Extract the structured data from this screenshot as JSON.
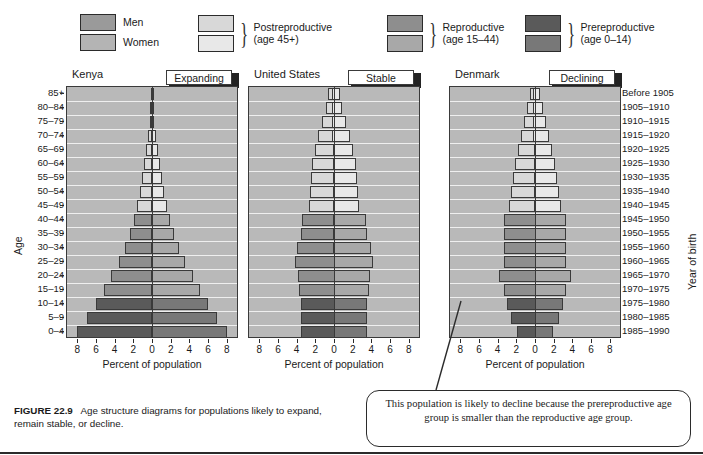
{
  "figure": {
    "number": "FIGURE 22.9",
    "caption": "Age structure diagrams for populations likely to expand, remain stable, or decline."
  },
  "legend": {
    "sex": [
      {
        "label": "Men",
        "color": "#9a9a9a"
      },
      {
        "label": "Women",
        "color": "#b4b4b4"
      }
    ],
    "groups": [
      {
        "label_line1": "Postreproductive",
        "label_line2": "(age 45+)",
        "men_color": "#d8d8d8",
        "women_color": "#e8e8e8"
      },
      {
        "label_line1": "Reproductive",
        "label_line2": "(age 15–44)",
        "men_color": "#8e8e8e",
        "women_color": "#a8a8a8"
      },
      {
        "label_line1": "Prereproductive",
        "label_line2": "(age 0–14)",
        "men_color": "#5a5a5a",
        "women_color": "#787878"
      }
    ]
  },
  "axes": {
    "y_left_title": "Age",
    "y_right_title": "Year of birth",
    "x_title": "Percent of population",
    "x_ticks": [
      "8",
      "6",
      "4",
      "2",
      "0",
      "2",
      "4",
      "6",
      "8"
    ],
    "x_max": 9.2,
    "age_groups": [
      "85+",
      "80–84",
      "75–79",
      "70–74",
      "65–69",
      "60–64",
      "55–59",
      "50–54",
      "45–49",
      "40–44",
      "35–39",
      "30–34",
      "25–29",
      "20–24",
      "15–19",
      "10–14",
      "5–9",
      "0–4"
    ],
    "years_of_birth": [
      "Before 1905",
      "1905–1910",
      "1910–1915",
      "1915–1920",
      "1920–1925",
      "1925–1930",
      "1930–1935",
      "1935–1940",
      "1940–1945",
      "1945–1950",
      "1950–1955",
      "1955–1960",
      "1960–1965",
      "1965–1970",
      "1970–1975",
      "1975–1980",
      "1980–1985",
      "1985–1990"
    ]
  },
  "callout": {
    "text": "This population is likely to decline because the prereproductive age group is smaller than the reproductive age group."
  },
  "chart_data": {
    "type": "bar",
    "title": "Age structure diagrams for populations likely to expand, remain stable, or decline.",
    "subtype": "population-pyramid",
    "xlabel": "Percent of population",
    "ylabel": "Age",
    "ylabel_right": "Year of birth",
    "xlim": [
      -9.2,
      9.2
    ],
    "xticks": [
      8,
      6,
      4,
      2,
      0,
      2,
      4,
      6,
      8
    ],
    "grid": true,
    "legend_position": "top",
    "categories": [
      "85+",
      "80–84",
      "75–79",
      "70–74",
      "65–69",
      "60–64",
      "55–59",
      "50–54",
      "45–49",
      "40–44",
      "35–39",
      "30–34",
      "25–29",
      "20–24",
      "15–19",
      "10–14",
      "5–9",
      "0–4"
    ],
    "age_class": [
      "post",
      "post",
      "post",
      "post",
      "post",
      "post",
      "post",
      "post",
      "post",
      "repro",
      "repro",
      "repro",
      "repro",
      "repro",
      "repro",
      "pre",
      "pre",
      "pre"
    ],
    "panels": [
      {
        "name": "Kenya",
        "tab": "Expanding",
        "series": [
          {
            "name": "Men",
            "values": [
              0.12,
              0.2,
              0.3,
              0.45,
              0.65,
              0.85,
              1.05,
              1.3,
              1.6,
              1.95,
              2.4,
              2.9,
              3.6,
              4.4,
              5.2,
              6.0,
              7.0,
              8.0
            ]
          },
          {
            "name": "Women",
            "values": [
              0.15,
              0.22,
              0.32,
              0.48,
              0.68,
              0.9,
              1.1,
              1.35,
              1.65,
              2.0,
              2.45,
              2.95,
              3.65,
              4.45,
              5.25,
              6.05,
              7.05,
              8.05
            ]
          }
        ]
      },
      {
        "name": "United States",
        "tab": "Stable",
        "series": [
          {
            "name": "Men",
            "values": [
              0.5,
              0.8,
              1.2,
              1.6,
              2.0,
              2.3,
              2.5,
              2.6,
              2.7,
              3.4,
              3.5,
              4.0,
              4.2,
              3.9,
              3.8,
              3.6,
              3.6,
              3.6
            ]
          },
          {
            "name": "Women",
            "values": [
              0.9,
              1.1,
              1.5,
              1.9,
              2.2,
              2.5,
              2.6,
              2.7,
              2.8,
              3.5,
              3.6,
              4.1,
              4.2,
              3.9,
              3.8,
              3.6,
              3.6,
              3.6
            ]
          }
        ]
      },
      {
        "name": "Denmark",
        "tab": "Declining",
        "series": [
          {
            "name": "Men",
            "values": [
              0.4,
              0.7,
              1.0,
              1.4,
              1.8,
              2.1,
              2.4,
              2.6,
              2.8,
              3.4,
              3.4,
              3.4,
              3.4,
              3.9,
              3.4,
              3.0,
              2.6,
              2.0
            ]
          },
          {
            "name": "Women",
            "values": [
              0.8,
              1.1,
              1.4,
              1.7,
              2.0,
              2.3,
              2.5,
              2.7,
              2.9,
              3.4,
              3.4,
              3.4,
              3.4,
              3.9,
              3.4,
              3.0,
              2.6,
              2.0
            ]
          }
        ]
      }
    ],
    "colors": {
      "post_men": "#d8d8d8",
      "post_women": "#e8e8e8",
      "repro_men": "#8e8e8e",
      "repro_women": "#a8a8a8",
      "pre_men": "#5a5a5a",
      "pre_women": "#787878",
      "plot_background": "#b9b9b9",
      "gridline": "#efefef",
      "axis": "#3a3a3a"
    }
  }
}
